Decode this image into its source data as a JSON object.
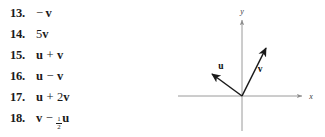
{
  "exercises": [
    {
      "number": "13.",
      "tokens": [
        {
          "kind": "minus-lead",
          "text": "−"
        },
        {
          "kind": "vec",
          "text": "v"
        }
      ]
    },
    {
      "number": "14.",
      "tokens": [
        {
          "kind": "scalar",
          "text": "5"
        },
        {
          "kind": "vec",
          "text": "v"
        }
      ]
    },
    {
      "number": "15.",
      "tokens": [
        {
          "kind": "vec",
          "text": "u"
        },
        {
          "kind": "op",
          "text": "+"
        },
        {
          "kind": "vec",
          "text": "v"
        }
      ]
    },
    {
      "number": "16.",
      "tokens": [
        {
          "kind": "vec",
          "text": "u"
        },
        {
          "kind": "op",
          "text": "−"
        },
        {
          "kind": "vec",
          "text": "v"
        }
      ]
    },
    {
      "number": "17.",
      "tokens": [
        {
          "kind": "vec",
          "text": "u"
        },
        {
          "kind": "op",
          "text": "+"
        },
        {
          "kind": "scalar",
          "text": "2"
        },
        {
          "kind": "vec",
          "text": "v"
        }
      ]
    },
    {
      "number": "18.",
      "tokens": [
        {
          "kind": "vec",
          "text": "v"
        },
        {
          "kind": "op",
          "text": "−"
        },
        {
          "kind": "frac",
          "num": "1",
          "den": "2"
        },
        {
          "kind": "vec",
          "text": "u"
        }
      ]
    }
  ],
  "diagram": {
    "x_axis_label": "x",
    "y_axis_label": "y",
    "origin": {
      "x": 122,
      "y": 96
    },
    "axis_color": "#9a9a9a",
    "vector_color": "#1a1a1a",
    "x_axis": {
      "x1": 58,
      "x2": 184,
      "y": 96
    },
    "y_axis": {
      "x": 122,
      "y1": 18,
      "y2": 131
    },
    "vectors": [
      {
        "name": "u",
        "label": "u",
        "tip": {
          "x": 89,
          "y": 72
        },
        "label_pos": {
          "x": 101,
          "y": 69
        }
      },
      {
        "name": "v",
        "label": "v",
        "tip": {
          "x": 148,
          "y": 45
        },
        "label_pos": {
          "x": 140,
          "y": 70
        }
      }
    ]
  }
}
